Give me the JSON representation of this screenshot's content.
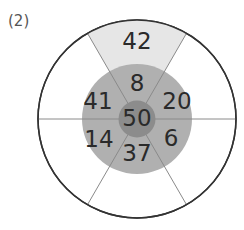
{
  "problem_label": "(2)",
  "diagram": {
    "center": [
      137,
      119
    ],
    "radii": {
      "outer": 99,
      "middle": 55,
      "inner": 18.5
    },
    "colors": {
      "outer_ring": "#ffffff",
      "highlight_sector": "#e6e6e6",
      "middle_ring": "#b0b0b0",
      "inner_circle": "#8c8c8c",
      "outline": "#333333",
      "spoke": "#8a8a8a"
    },
    "spoke_angles_deg": [
      0,
      60,
      120,
      180,
      240,
      300
    ],
    "center_value": "50",
    "middle_ring_values": {
      "top": "8",
      "upper_right": "20",
      "lower_right": "6",
      "bottom": "37",
      "lower_left": "14",
      "upper_left": "41"
    },
    "outer_ring_values": {
      "top": "42",
      "upper_right": "",
      "lower_right": "",
      "bottom": "",
      "lower_left": "",
      "upper_left": ""
    }
  }
}
